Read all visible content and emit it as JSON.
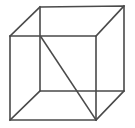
{
  "figure": {
    "background_color": "#ffffff",
    "line_color": "#4a4a4a",
    "line_width": 1.6,
    "canvas": {
      "width": 135,
      "height": 128
    }
  },
  "geometry": {
    "type": "wireframe-polyhedron",
    "shape": "cube",
    "projection": "oblique",
    "vertices": [
      {
        "id": "front-top-left",
        "x": 10,
        "y": 36
      },
      {
        "id": "front-top-right",
        "x": 96,
        "y": 36
      },
      {
        "id": "front-bottom-right",
        "x": 96,
        "y": 120
      },
      {
        "id": "front-bottom-left",
        "x": 10,
        "y": 120
      },
      {
        "id": "back-top-left",
        "x": 40,
        "y": 7
      },
      {
        "id": "back-top-right",
        "x": 124,
        "y": 6
      },
      {
        "id": "back-bottom-right",
        "x": 124,
        "y": 91
      },
      {
        "id": "back-bottom-left",
        "x": 40,
        "y": 91
      }
    ],
    "edges": [
      {
        "id": "front-top",
        "from": "front-top-left",
        "to": "front-top-right"
      },
      {
        "id": "front-right",
        "from": "front-top-right",
        "to": "front-bottom-right"
      },
      {
        "id": "front-bottom",
        "from": "front-bottom-right",
        "to": "front-bottom-left"
      },
      {
        "id": "front-left",
        "from": "front-bottom-left",
        "to": "front-top-left"
      },
      {
        "id": "back-top",
        "from": "back-top-left",
        "to": "back-top-right"
      },
      {
        "id": "back-right",
        "from": "back-top-right",
        "to": "back-bottom-right"
      },
      {
        "id": "back-bottom",
        "from": "back-bottom-right",
        "to": "back-bottom-left"
      },
      {
        "id": "back-left",
        "from": "back-bottom-left",
        "to": "back-top-left"
      },
      {
        "id": "connector-top-left",
        "from": "front-top-left",
        "to": "back-top-left"
      },
      {
        "id": "connector-top-right",
        "from": "front-top-right",
        "to": "back-top-right"
      },
      {
        "id": "connector-bottom-right",
        "from": "front-bottom-right",
        "to": "back-bottom-right"
      },
      {
        "id": "connector-bottom-left",
        "from": "front-bottom-left",
        "to": "back-bottom-left"
      }
    ],
    "diagonals": [
      {
        "id": "internal-diagonal",
        "from": {
          "x": 41,
          "y": 37
        },
        "to": {
          "x": 96,
          "y": 120
        },
        "note": "space diagonal from back-top-left corner down to front-bottom-right corner"
      }
    ],
    "paths": {
      "front_face": "M 10 36 L 96 36 L 96 120 L 10 120 Z",
      "back_face": "M 40 7 L 124 6 L 124 91 L 40 91 Z",
      "connector_top_left": "M 10 36 L 40 7",
      "connector_top_right": "M 96 36 L 124 6",
      "connector_bottom_right": "M 96 120 L 124 91",
      "connector_bottom_left": "M 10 120 L 40 91",
      "internal_diagonal": "M 41 37 L 96 120"
    }
  }
}
